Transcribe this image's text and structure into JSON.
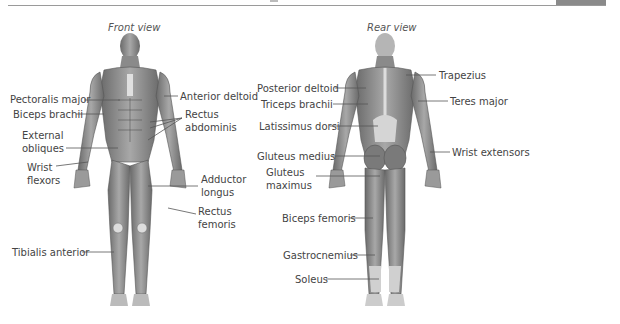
{
  "diagram": {
    "front": {
      "title": "Front view",
      "labels": {
        "pectoralis_major": "Pectoralis major",
        "biceps_brachii": "Biceps brachii",
        "external_obliques_1": "External",
        "external_obliques_2": "obliques",
        "wrist_flexors_1": "Wrist",
        "wrist_flexors_2": "flexors",
        "tibialis_anterior": "Tibialis anterior",
        "anterior_deltoid": "Anterior deltoid",
        "rectus_abdominis_1": "Rectus",
        "rectus_abdominis_2": "abdominis",
        "adductor_longus_1": "Adductor",
        "adductor_longus_2": "longus",
        "rectus_femoris_1": "Rectus",
        "rectus_femoris_2": "femoris"
      }
    },
    "rear": {
      "title": "Rear view",
      "labels": {
        "posterior_deltoid": "Posterior deltoid",
        "triceps_brachii": "Triceps brachii",
        "latissimus_dorsi": "Latissimus dorsi",
        "gluteus_medius": "Gluteus medius",
        "gluteus_maximus_1": "Gluteus",
        "gluteus_maximus_2": "maximus",
        "biceps_femoris": "Biceps femoris",
        "gastrocnemius": "Gastrocnemius",
        "soleus": "Soleus",
        "trapezius": "Trapezius",
        "teres_major": "Teres major",
        "wrist_extensors": "Wrist extensors"
      }
    }
  },
  "colors": {
    "muscle": "#8c8c8c",
    "muscle_dark": "#5e5e5e",
    "tendon": "#d9d9d9",
    "line": "#555555",
    "text": "#444444"
  }
}
